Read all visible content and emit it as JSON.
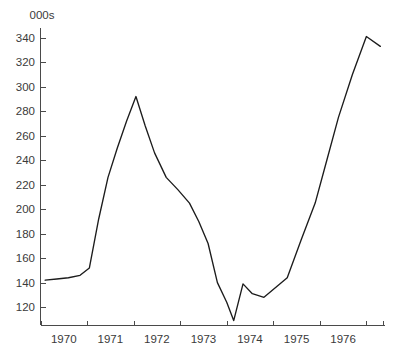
{
  "chart_data": {
    "type": "line",
    "title": "",
    "subtitle": "",
    "xlabel": "",
    "ylabel": "",
    "unit_label": "000s",
    "grid": false,
    "legend": false,
    "xlim": [
      1969.5,
      1976.9
    ],
    "ylim": [
      105,
      348
    ],
    "y_ticks": [
      120,
      140,
      160,
      180,
      200,
      220,
      240,
      260,
      280,
      300,
      320,
      340
    ],
    "y_tick_labels": [
      "120",
      "140",
      "160",
      "180",
      "200",
      "220",
      "240",
      "260",
      "280",
      "300",
      "320",
      "340"
    ],
    "x_tick_labels": [
      "1970",
      "1971",
      "1972",
      "1973",
      "1974",
      "1975",
      "1976"
    ],
    "x_tick_label_positions": [
      1970,
      1971,
      1972,
      1973,
      1974,
      1975,
      1976
    ],
    "x_tick_mark_positions": [
      1969.5,
      1970.5,
      1971.5,
      1972.5,
      1973.5,
      1974.5,
      1975.5,
      1976.5,
      1976.85
    ],
    "series": [
      {
        "name": "series-1",
        "color": "#1c1c1c",
        "x": [
          1969.6,
          1969.85,
          1970.1,
          1970.35,
          1970.55,
          1970.75,
          1970.95,
          1971.15,
          1971.35,
          1971.55,
          1971.75,
          1971.95,
          1972.2,
          1972.45,
          1972.7,
          1972.9,
          1973.1,
          1973.3,
          1973.5,
          1973.65,
          1973.85,
          1974.05,
          1974.3,
          1974.55,
          1974.8,
          1975.1,
          1975.4,
          1975.65,
          1975.9,
          1976.2,
          1976.5,
          1976.8
        ],
        "values": [
          142,
          143,
          144,
          146,
          152,
          192,
          226,
          250,
          272,
          292,
          268,
          246,
          226,
          216,
          205,
          190,
          172,
          140,
          124,
          109,
          139,
          131,
          128,
          136,
          144,
          175,
          205,
          240,
          275,
          310,
          341,
          333
        ]
      }
    ],
    "annotations": {
      "peak_1": 292,
      "minimum": 109,
      "peak_2": 341,
      "final_value": 324
    }
  },
  "axes": {
    "y_axis_name": "y-axis",
    "x_axis_name": "x-axis"
  }
}
